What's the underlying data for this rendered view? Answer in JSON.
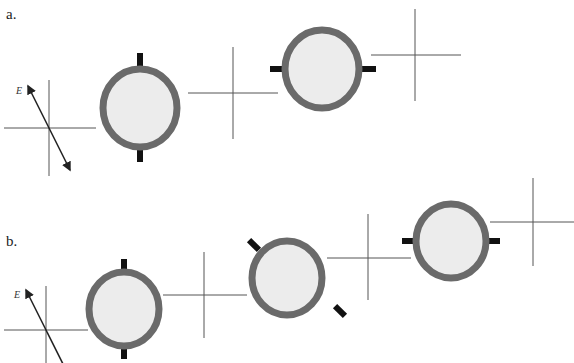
{
  "parts": [
    {
      "label": "a.",
      "field_label": "E⃗",
      "polarizers": [
        {
          "name": "polarizer-1",
          "axis_angle_deg": 0
        },
        {
          "name": "polarizer-2",
          "axis_angle_deg": 90
        }
      ]
    },
    {
      "label": "b.",
      "field_label": "E⃗",
      "polarizers": [
        {
          "name": "polarizer-1",
          "axis_angle_deg": 0
        },
        {
          "name": "polarizer-2",
          "axis_angle_deg": 45
        },
        {
          "name": "polarizer-3",
          "axis_angle_deg": 90
        }
      ]
    }
  ]
}
